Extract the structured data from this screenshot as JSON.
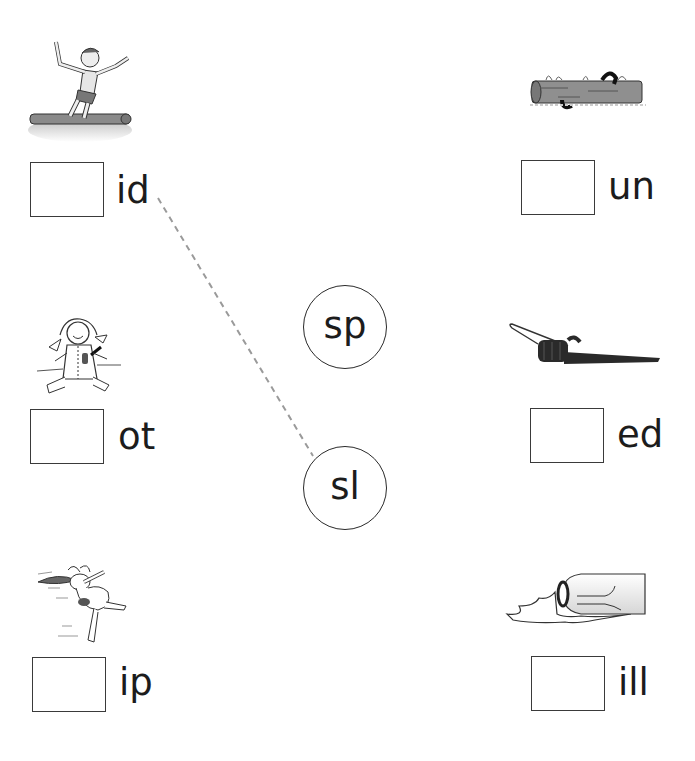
{
  "worksheet": {
    "items": [
      {
        "picture": "boy-slipping-off-log-picture",
        "ending": "id",
        "answer": ""
      },
      {
        "picture": "log-in-water-picture",
        "ending": "un",
        "answer": ""
      },
      {
        "picture": "doll-with-pocket-picture",
        "ending": "ot",
        "answer": ""
      },
      {
        "picture": "sled-picture",
        "ending": "ed",
        "answer": ""
      },
      {
        "picture": "rabbit-jumping-picture",
        "ending": "ip",
        "answer": ""
      },
      {
        "picture": "spilled-bottle-picture",
        "ending": "ill",
        "answer": ""
      }
    ],
    "blends": [
      {
        "label": "sp"
      },
      {
        "label": "sl"
      }
    ],
    "example_connection": {
      "from_ending": "id",
      "to_blend": "sl"
    }
  },
  "colors": {
    "ink": "#1c1c1c",
    "box_border": "#3a3a3a",
    "dashed_line": "#9a9a9a",
    "background": "#ffffff"
  }
}
